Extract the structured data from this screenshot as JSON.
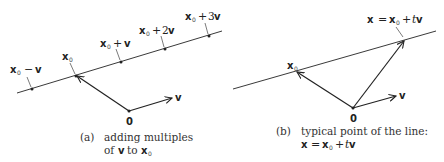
{
  "panels": [
    {
      "id": "a",
      "caption_tag": "(a)",
      "caption_line1": "adding multiples",
      "caption_line2_prefix": "of",
      "caption_line2_vec": "v",
      "caption_line2_mid": "to",
      "caption_line2_vec2": "x",
      "caption_line2_sub": "0",
      "origin_label": "0",
      "v_label": "v",
      "points": [
        {
          "name": "x0-minus-v",
          "base": "x",
          "sub": "0",
          "op": "−",
          "coef": "",
          "vec": "v"
        },
        {
          "name": "x0",
          "base": "x",
          "sub": "0",
          "op": "",
          "coef": "",
          "vec": ""
        },
        {
          "name": "x0-plus-v",
          "base": "x",
          "sub": "0",
          "op": "+",
          "coef": "",
          "vec": "v"
        },
        {
          "name": "x0-plus-2v",
          "base": "x",
          "sub": "0",
          "op": "+",
          "coef": "2",
          "vec": "v"
        },
        {
          "name": "x0-plus-3v",
          "base": "x",
          "sub": "0",
          "op": "+",
          "coef": "3",
          "vec": "v"
        }
      ]
    },
    {
      "id": "b",
      "caption_tag": "(b)",
      "caption_line1": "typical point of the line:",
      "caption_eq": {
        "lhs": "x",
        "eq": "=",
        "base": "x",
        "sub": "0",
        "op": "+",
        "t": "t",
        "vec": "v"
      },
      "origin_label": "0",
      "v_label": "v",
      "x0_label": {
        "base": "x",
        "sub": "0"
      },
      "point_label": {
        "lhs": "x",
        "eq": "=",
        "base": "x",
        "sub": "0",
        "op": "+",
        "t": "t",
        "vec": "v"
      }
    }
  ],
  "colors": {
    "ink": "#222222",
    "background": "#ffffff"
  }
}
